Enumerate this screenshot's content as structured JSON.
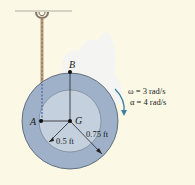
{
  "diagram": {
    "points": {
      "A": "A",
      "B": "B",
      "G": "G"
    },
    "dimensions": {
      "inner_radius": "0.5 ft",
      "outer_radius": "0.75 ft"
    },
    "kinematics": {
      "omega": "ω = 3 rad/s",
      "alpha": "α = 4 rad/s"
    },
    "colors": {
      "background": "#fbf9e6",
      "outer_disk": "#9fb1c8",
      "inner_disk": "#c4d0de",
      "rope": "#b79a7a",
      "arrow": "#3d7fa6"
    }
  }
}
